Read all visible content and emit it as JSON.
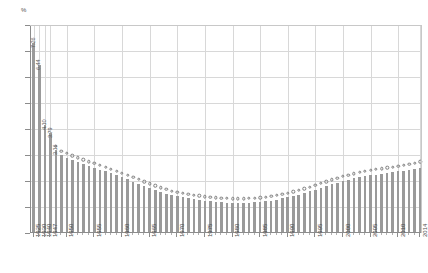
{
  "axis": {
    "y_unit_label": "%",
    "y_ticks": [
      "0",
      "1",
      "2",
      "3",
      "4",
      "5",
      "6",
      "7",
      "8"
    ]
  },
  "chart_data": {
    "type": "bar",
    "title": "",
    "subtitle": "",
    "xlabel": "",
    "ylabel": "%",
    "ylim": [
      0,
      8
    ],
    "grid": true,
    "legend_position": "none",
    "axis_unit": "%",
    "x_tick_labels": [
      "1925",
      "1930",
      "1940",
      "1947",
      "1950",
      "1955",
      "1960",
      "1965",
      "1970",
      "1975",
      "1980",
      "1985",
      "1990",
      "1995",
      "2000",
      "2005",
      "2010",
      "2014"
    ],
    "categories": [
      "1925",
      "1930",
      "1940",
      "1947",
      "1948",
      "1949",
      "1950",
      "1951",
      "1952",
      "1953",
      "1954",
      "1955",
      "1956",
      "1957",
      "1958",
      "1959",
      "1960",
      "1961",
      "1962",
      "1963",
      "1964",
      "1965",
      "1966",
      "1967",
      "1968",
      "1969",
      "1970",
      "1971",
      "1972",
      "1973",
      "1974",
      "1975",
      "1976",
      "1977",
      "1978",
      "1979",
      "1980",
      "1981",
      "1982",
      "1983",
      "1984",
      "1985",
      "1986",
      "1987",
      "1988",
      "1989",
      "1990",
      "1991",
      "1992",
      "1993",
      "1994",
      "1995",
      "1996",
      "1997",
      "1998",
      "1999",
      "2000",
      "2001",
      "2002",
      "2003",
      "2004",
      "2005",
      "2006",
      "2007",
      "2008",
      "2009",
      "2010",
      "2011",
      "2012",
      "2013",
      "2014"
    ],
    "series": [
      {
        "name": "bars",
        "type": "bar",
        "values": [
          7.26,
          6.44,
          4.1,
          3.79,
          3.16,
          2.95,
          2.86,
          2.78,
          2.7,
          2.62,
          2.55,
          2.48,
          2.4,
          2.33,
          2.26,
          2.18,
          2.1,
          2.02,
          1.94,
          1.86,
          1.78,
          1.7,
          1.62,
          1.55,
          1.48,
          1.42,
          1.37,
          1.33,
          1.29,
          1.26,
          1.23,
          1.2,
          1.18,
          1.16,
          1.14,
          1.13,
          1.12,
          1.12,
          1.12,
          1.13,
          1.14,
          1.16,
          1.18,
          1.21,
          1.25,
          1.29,
          1.34,
          1.39,
          1.44,
          1.5,
          1.56,
          1.62,
          1.69,
          1.76,
          1.83,
          1.9,
          1.96,
          2.01,
          2.06,
          2.1,
          2.14,
          2.18,
          2.21,
          2.24,
          2.27,
          2.3,
          2.33,
          2.36,
          2.4,
          2.44,
          2.48
        ],
        "labels": [
          "7.26",
          "6.44",
          "4.10",
          "3.79",
          "3.16",
          "",
          "",
          "",
          "",
          "",
          "",
          "",
          "",
          "",
          "",
          "",
          "",
          "",
          "",
          "",
          "",
          "",
          "",
          "",
          "",
          "",
          "",
          "",
          "",
          "",
          "",
          "",
          "",
          "",
          "",
          "",
          "",
          "",
          "",
          "",
          "",
          "",
          "",
          "",
          "",
          "",
          "",
          "",
          "",
          "",
          "",
          "",
          "",
          "",
          "",
          "",
          "",
          "",
          "",
          "",
          "",
          "",
          "",
          "",
          "",
          "",
          "",
          "",
          "",
          "",
          ""
        ]
      },
      {
        "name": "markers",
        "type": "line",
        "values": [
          null,
          null,
          null,
          null,
          3.3,
          3.12,
          3.02,
          2.94,
          2.86,
          2.78,
          2.71,
          2.64,
          2.56,
          2.49,
          2.42,
          2.34,
          2.26,
          2.18,
          2.1,
          2.02,
          1.94,
          1.86,
          1.78,
          1.71,
          1.64,
          1.58,
          1.53,
          1.49,
          1.45,
          1.42,
          1.39,
          1.36,
          1.34,
          1.32,
          1.3,
          1.29,
          1.28,
          1.28,
          1.28,
          1.29,
          1.3,
          1.32,
          1.34,
          1.37,
          1.41,
          1.45,
          1.5,
          1.55,
          1.61,
          1.67,
          1.73,
          1.8,
          1.87,
          1.94,
          2.01,
          2.08,
          2.14,
          2.19,
          2.24,
          2.29,
          2.33,
          2.37,
          2.41,
          2.44,
          2.47,
          2.5,
          2.53,
          2.57,
          2.61,
          2.65,
          2.7
        ]
      }
    ]
  }
}
